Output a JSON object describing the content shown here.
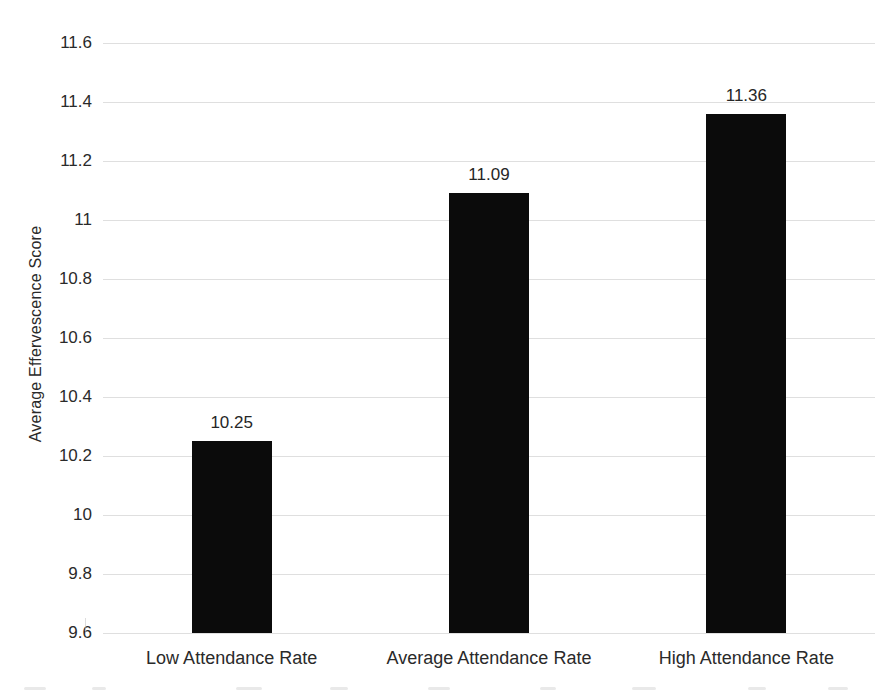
{
  "figure": {
    "background": "#ffffff",
    "text_color": "#2a2a2a"
  },
  "chart_data": {
    "type": "bar",
    "title": "",
    "xlabel": "",
    "ylabel": "Average Effervescence Score",
    "categories": [
      "Low Attendance Rate",
      "Average Attendance Rate",
      "High Attendance Rate"
    ],
    "values": [
      10.25,
      11.09,
      11.36
    ],
    "data_labels": [
      "10.25",
      "11.09",
      "11.36"
    ],
    "ylim": [
      9.6,
      11.6
    ],
    "ytick_step": 0.2,
    "ytick_labels": [
      "9.6",
      "9.8",
      "10",
      "10.2",
      "10.4",
      "10.6",
      "10.8",
      "11",
      "11.2",
      "11.4",
      "11.6"
    ],
    "grid": true,
    "legend_position": "none",
    "bar_color": "#0b0b0b",
    "gridline_color": "#d9d9d9",
    "label_color": "#262626"
  }
}
